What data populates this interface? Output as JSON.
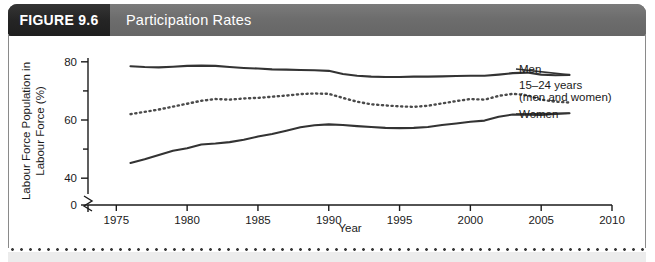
{
  "header": {
    "figure_label": "FIGURE 9.6",
    "title": "Participation Rates",
    "figure_block_color": "#252525",
    "bar_color": "#6f6f6f",
    "text_color": "#ffffff"
  },
  "chart_data": {
    "type": "line",
    "title": "Participation Rates",
    "xlabel": "Year",
    "ylabel": "Labour Force Population in Labour Force (%)",
    "xlim": [
      1973,
      2010
    ],
    "ylim": [
      0,
      82
    ],
    "xticks": [
      1975,
      1980,
      1985,
      1990,
      1995,
      2000,
      2005,
      2010
    ],
    "xtick_labels": [
      "1975",
      "1980",
      "1985",
      "1990",
      "1995",
      "2000",
      "2005",
      "2010"
    ],
    "yticks": [
      0,
      40,
      50,
      60,
      70,
      80
    ],
    "ytick_labels": [
      "0",
      "40",
      "60",
      "80"
    ],
    "y_axis_break": true,
    "y_axis_break_between": [
      0,
      40
    ],
    "grid": false,
    "legend_position": "right-inline",
    "line_color": "#333333",
    "series": [
      {
        "name": "Men",
        "style": "solid",
        "label": "Men",
        "x": [
          1976,
          1977,
          1978,
          1979,
          1980,
          1981,
          1982,
          1983,
          1984,
          1985,
          1986,
          1987,
          1988,
          1989,
          1990,
          1991,
          1992,
          1993,
          1994,
          1995,
          1996,
          1997,
          1998,
          1999,
          2000,
          2001,
          2002,
          2003,
          2004,
          2005,
          2006,
          2007
        ],
        "values": [
          78.5,
          78.2,
          78.1,
          78.3,
          78.6,
          78.7,
          78.6,
          78.2,
          77.9,
          77.7,
          77.4,
          77.3,
          77.2,
          77.1,
          76.9,
          75.8,
          75.2,
          74.9,
          74.8,
          74.8,
          74.9,
          74.9,
          75.0,
          75.1,
          75.2,
          75.2,
          75.6,
          76.1,
          76.3,
          75.6,
          75.4,
          75.5
        ]
      },
      {
        "name": "15-24 years (men and women)",
        "style": "dotted",
        "label_line1": "15–24 years",
        "label_line2": "(men and women)",
        "x": [
          1976,
          1977,
          1978,
          1979,
          1980,
          1981,
          1982,
          1983,
          1984,
          1985,
          1986,
          1987,
          1988,
          1989,
          1990,
          1991,
          1992,
          1993,
          1994,
          1995,
          1996,
          1997,
          1998,
          1999,
          2000,
          2001,
          2002,
          2003,
          2004,
          2005,
          2006,
          2007
        ],
        "values": [
          62.0,
          62.8,
          63.6,
          64.6,
          65.6,
          66.6,
          67.2,
          67.0,
          67.4,
          67.6,
          68.0,
          68.4,
          68.9,
          69.1,
          69.0,
          67.6,
          66.3,
          65.4,
          65.0,
          64.7,
          64.5,
          64.9,
          65.7,
          66.5,
          67.2,
          67.0,
          68.3,
          69.0,
          68.5,
          67.0,
          66.3,
          66.0
        ]
      },
      {
        "name": "Women",
        "style": "solid",
        "label": "Women",
        "x": [
          1976,
          1977,
          1978,
          1979,
          1980,
          1981,
          1982,
          1983,
          1984,
          1985,
          1986,
          1987,
          1988,
          1989,
          1990,
          1991,
          1992,
          1993,
          1994,
          1995,
          1996,
          1997,
          1998,
          1999,
          2000,
          2001,
          2002,
          2003,
          2004,
          2005,
          2006,
          2007
        ],
        "values": [
          45.2,
          46.5,
          48.0,
          49.4,
          50.3,
          51.6,
          51.9,
          52.4,
          53.2,
          54.3,
          55.2,
          56.3,
          57.5,
          58.2,
          58.5,
          58.3,
          57.9,
          57.6,
          57.3,
          57.2,
          57.3,
          57.6,
          58.3,
          58.8,
          59.4,
          59.8,
          61.1,
          61.9,
          61.8,
          61.7,
          62.1,
          62.3
        ]
      }
    ]
  }
}
